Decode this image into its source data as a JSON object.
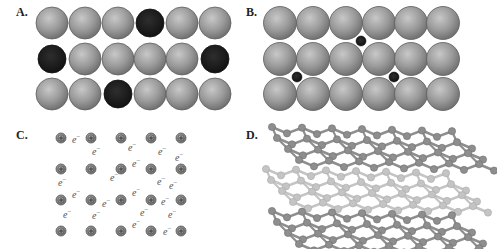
{
  "figure": {
    "panels": [
      {
        "id": "A",
        "label": "A.",
        "label_pos": [
          16,
          5
        ],
        "description": "substitutional alloy lattice",
        "large_atom_color": "#8c8c8c",
        "substitute_atom_color": "#1a1a1a",
        "rows_y": [
          23,
          59,
          94
        ],
        "cols_x": [
          52,
          85,
          118,
          150,
          182,
          215
        ],
        "radius": 16,
        "substituted": [
          [
            0,
            3
          ],
          [
            1,
            0
          ],
          [
            1,
            5
          ],
          [
            2,
            2
          ]
        ]
      },
      {
        "id": "B",
        "label": "B.",
        "label_pos": [
          246,
          5
        ],
        "description": "interstitial alloy lattice",
        "large_atom_color": "#8c8c8c",
        "interstitial_atom_color": "#1a1a1a",
        "rows_y": [
          23,
          59,
          94
        ],
        "cols_x": [
          280,
          313,
          346,
          379,
          411,
          443
        ],
        "radius": 16.5,
        "interstitials": [
          [
            361,
            41
          ],
          [
            297,
            77
          ],
          [
            394,
            77
          ]
        ],
        "interstitial_radius": 5
      },
      {
        "id": "C",
        "label": "C.",
        "label_pos": [
          16,
          128
        ],
        "description": "metallic bonding: cations in a sea of electrons",
        "ion_symbol": "+",
        "electron_symbol": "e",
        "electron_superscript": "−",
        "ion_color": "#8a8a8a",
        "ion_radius": 5,
        "ion_rows_y": [
          138,
          169,
          200,
          231
        ],
        "ion_cols_x": [
          61,
          91,
          121,
          151,
          181
        ],
        "electrons": [
          [
            72,
            143
          ],
          [
            92,
            155
          ],
          [
            128,
            151
          ],
          [
            158,
            155
          ],
          [
            175,
            161
          ],
          [
            132,
            167
          ],
          [
            58,
            186
          ],
          [
            110,
            181
          ],
          [
            157,
            185
          ],
          [
            169,
            189
          ],
          [
            72,
            198
          ],
          [
            102,
            207
          ],
          [
            132,
            196
          ],
          [
            161,
            205
          ],
          [
            63,
            218
          ],
          [
            92,
            219
          ],
          [
            140,
            216
          ],
          [
            168,
            218
          ],
          [
            132,
            228
          ],
          [
            163,
            235
          ]
        ]
      },
      {
        "id": "D",
        "label": "D.",
        "label_pos": [
          246,
          128
        ],
        "description": "graphite layered structure",
        "layers": [
          {
            "name": "top-layer",
            "color": "#8e8e8e",
            "x0": 272,
            "x1": 492,
            "y_top": 130,
            "y_bot": 163
          },
          {
            "name": "middle-layer",
            "color": "#c4c4c4",
            "x0": 266,
            "x1": 486,
            "y_top": 172,
            "y_bot": 205
          },
          {
            "name": "bottom-layer",
            "color": "#8e8e8e",
            "x0": 272,
            "x1": 492,
            "y_top": 214,
            "y_bot": 247
          }
        ]
      }
    ]
  }
}
